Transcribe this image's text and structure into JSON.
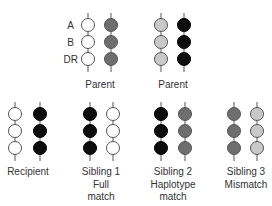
{
  "colors": {
    "white": "#ffffff",
    "dark_gray": "#6e6e6e",
    "light_gray": "#c9c9c9",
    "black": "#0d0d0d",
    "stroke": "#555555"
  },
  "loci": [
    "A",
    "B",
    "DR"
  ],
  "individuals": [
    {
      "id": "parent1",
      "label": "Parent",
      "haplotypes": [
        "white",
        "dark_gray"
      ]
    },
    {
      "id": "parent2",
      "label": "Parent",
      "haplotypes": [
        "light_gray",
        "black"
      ]
    },
    {
      "id": "recipient",
      "label": "Recipient",
      "haplotypes": [
        "white",
        "black"
      ]
    },
    {
      "id": "sibling1",
      "label": "Sibling 1\nFull\nmatch",
      "label_lines": [
        "Sibling 1",
        "Full",
        "match"
      ],
      "haplotypes": [
        "black",
        "white"
      ]
    },
    {
      "id": "sibling2",
      "label_lines": [
        "Sibling 2",
        "Haplotype",
        "match"
      ],
      "haplotypes": [
        "black",
        "dark_gray"
      ]
    },
    {
      "id": "sibling3",
      "label_lines": [
        "Sibling 3",
        "Mismatch"
      ],
      "haplotypes": [
        "dark_gray",
        "light_gray"
      ]
    }
  ],
  "labels": {
    "parent1": "Parent",
    "parent2": "Parent",
    "recipient": "Recipient",
    "sibling1": [
      "Sibling 1",
      "Full",
      "match"
    ],
    "sibling2": [
      "Sibling 2",
      "Haplotype",
      "match"
    ],
    "sibling3": [
      "Sibling 3",
      "Mismatch"
    ],
    "locus_a": "A",
    "locus_b": "B",
    "locus_dr": "DR"
  }
}
